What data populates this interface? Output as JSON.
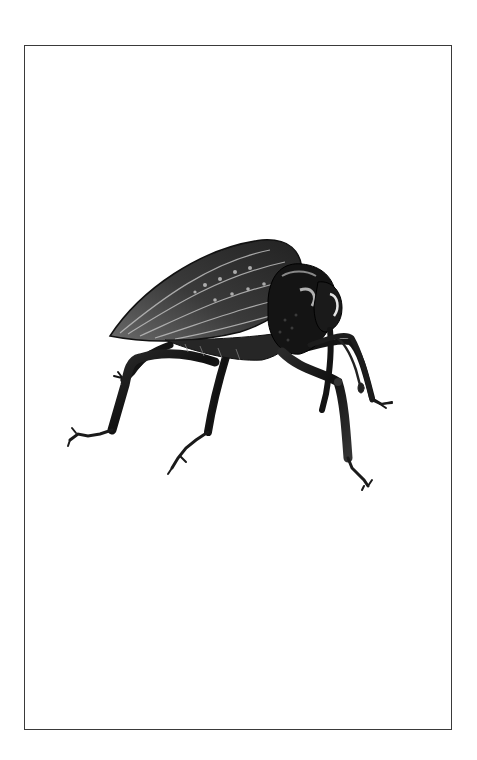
{
  "artwork": {
    "subject": "weevil beetle illustration",
    "style": "black and white engraving",
    "colors": {
      "background": "#ffffff",
      "frame": "#3a3a3a",
      "ink_dark": "#141414",
      "ink_mid": "#4a4a4a",
      "ink_light": "#9a9a9a",
      "highlight": "#d8d8d8"
    }
  }
}
